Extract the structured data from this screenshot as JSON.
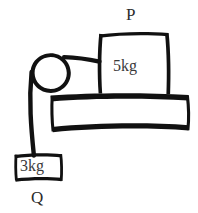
{
  "figure": {
    "title": "",
    "type": "free-body-pulley-diagram",
    "background_color": "#ffffff",
    "ink_color": "#111111",
    "text_color": "#2b2b2b"
  },
  "labels": {
    "block_top_label": "P",
    "block_hanging_label": "Q",
    "block_top_mass": "5kg",
    "block_hanging_mass": "3kg"
  },
  "elements": {
    "pulley": {
      "name": "pulley",
      "center_x": 50,
      "center_y": 73,
      "radius": 20
    },
    "table": {
      "name": "horizontal-surface",
      "x": 50,
      "y": 97,
      "width": 138,
      "height": 33
    },
    "block_p": {
      "name": "block-on-table",
      "x": 98,
      "y": 32,
      "width": 70,
      "height": 62,
      "mass": "5kg"
    },
    "block_q": {
      "name": "hanging-block",
      "x": 14,
      "y": 154,
      "width": 48,
      "height": 28,
      "mass": "3kg"
    },
    "rope_horizontal": {
      "name": "rope-horizontal-segment",
      "from_x": 66,
      "from_y": 59,
      "to_x": 98,
      "to_y": 62
    },
    "rope_vertical": {
      "name": "rope-vertical-segment",
      "from_x": 31,
      "from_y": 78,
      "to_x": 34,
      "to_y": 155
    }
  }
}
